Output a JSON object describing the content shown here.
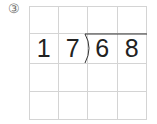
{
  "problem": {
    "number_label": "③",
    "divisor": "17",
    "dividend": "68",
    "grid": {
      "rows": 4,
      "cols": 4,
      "cells": [
        [
          "",
          "",
          "",
          ""
        ],
        [
          "1",
          "7",
          "6",
          "8"
        ],
        [
          "",
          "",
          "",
          ""
        ],
        [
          "",
          "",
          "",
          ""
        ]
      ]
    }
  },
  "colors": {
    "grid_line": "#d4d4d4",
    "digit": "#222222",
    "label": "#6e6e6e",
    "bracket": "#333333"
  }
}
